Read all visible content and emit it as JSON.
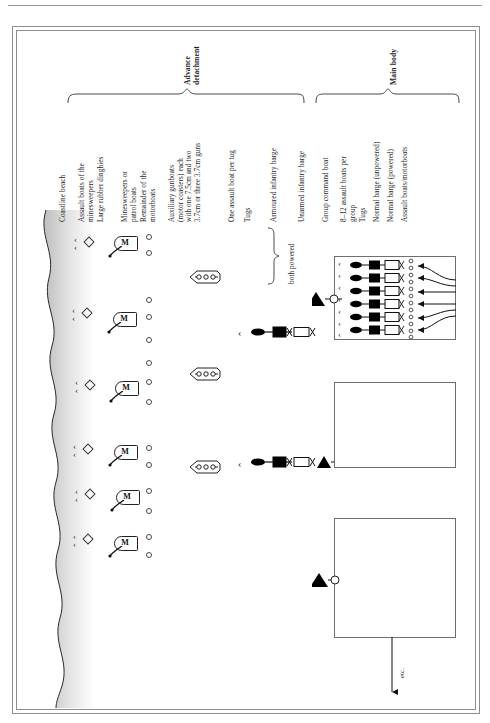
{
  "figure": {
    "headers": [
      {
        "id": "advance-detachment",
        "text": "Advance\ndetachment"
      },
      {
        "id": "main-body",
        "text": "Main body"
      }
    ],
    "labels": [
      {
        "id": "coastline-beach",
        "text": "Coastline beach"
      },
      {
        "id": "assault-boats-minesweepers",
        "text": "Assault boats of the\nminesweepers"
      },
      {
        "id": "large-rubber-dinghies",
        "text": "Large rubber dinghies"
      },
      {
        "id": "minesweepers-patrol-boats",
        "text": "Minesweepers or\npatrol boats"
      },
      {
        "id": "remainder-motorboats",
        "text": "Remainder of the\nmotorboats"
      },
      {
        "id": "auxiliary-gunboats",
        "text": "Auxiliary gunboats\n(motor coasters) each\nwith one 7.5cm and two\n3.7cm or three 3.7cm guns"
      },
      {
        "id": "one-assault-boat-per-tug",
        "text": "One assault boat per tug"
      },
      {
        "id": "tugs-advance",
        "text": "Tugs"
      },
      {
        "id": "armoured-infantry-barge",
        "text": "Armoured infantry barge"
      },
      {
        "id": "unarmed-infantry-barge",
        "text": "Unarmed infantry barge"
      },
      {
        "id": "both-powered",
        "text": "both powered"
      },
      {
        "id": "group-command-boat",
        "text": "Group command boat"
      },
      {
        "id": "assault-boats-per-group",
        "text": "8–12 assault boats per\ngroup"
      },
      {
        "id": "tugs-main",
        "text": "Tugs"
      },
      {
        "id": "normal-barge-unpowered",
        "text": "Normal barge (unpowered)"
      },
      {
        "id": "normal-barge-powered",
        "text": "Normal barge (powered)"
      },
      {
        "id": "assault-boats-motorboats",
        "text": "Assault boats/motorboats"
      }
    ],
    "annotations": {
      "etc": "etc.",
      "minesweeper_glyph": "M",
      "chevron_glyph": "‹"
    },
    "colors": {
      "ink": "#1d1d1d",
      "frame": "#8e8e8e",
      "fill_black": "#000000",
      "fill_white": "#ffffff",
      "beach": "#d9d9d9"
    },
    "counts": {
      "beach_marker_groups": 6,
      "minesweepers": 6,
      "gunboats": 3,
      "main_body_convoy_rows": 6,
      "group_boxes": 3
    }
  }
}
